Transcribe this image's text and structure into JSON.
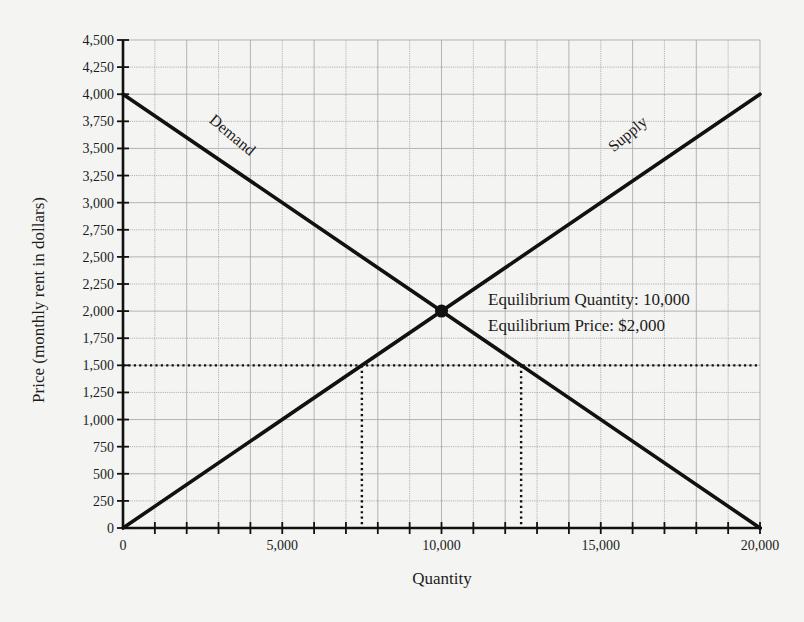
{
  "chart_data": {
    "type": "line",
    "title": "",
    "xlabel": "Quantity",
    "ylabel": "Price (monthly rent in dollars)",
    "xlim": [
      0,
      20000
    ],
    "ylim": [
      0,
      4500
    ],
    "x_ticks": [
      0,
      5000,
      10000,
      15000,
      20000
    ],
    "x_tick_labels": [
      "0",
      "5,000",
      "10,000",
      "15,000",
      "20,000"
    ],
    "x_minor_step": 1000,
    "y_ticks": [
      0,
      250,
      500,
      750,
      1000,
      1250,
      1500,
      1750,
      2000,
      2250,
      2500,
      2750,
      3000,
      3250,
      3500,
      3750,
      4000,
      4250,
      4500
    ],
    "y_tick_labels": [
      "0",
      "250",
      "500",
      "750",
      "1,000",
      "1,250",
      "1,500",
      "1,750",
      "2,000",
      "2,250",
      "2,500",
      "2,750",
      "3,000",
      "3,250",
      "3,500",
      "3,750",
      "4,000",
      "4,250",
      "4,500"
    ],
    "grid": true,
    "legend": null,
    "series": [
      {
        "name": "Demand",
        "x": [
          0,
          20000
        ],
        "y": [
          4000,
          0
        ],
        "label_text": "Demand"
      },
      {
        "name": "Supply",
        "x": [
          0,
          20000
        ],
        "y": [
          0,
          4000
        ],
        "label_text": "Supply"
      }
    ],
    "equilibrium": {
      "x": 10000,
      "y": 2000
    },
    "price_floor_line": {
      "y": 1500,
      "style": "dotted",
      "drop_lines_x": [
        7500,
        12500
      ]
    },
    "annotations": [
      "Equilibrium Quantity: 10,000",
      "Equilibrium Price: $2,000"
    ]
  },
  "labels": {
    "xlabel": "Quantity",
    "ylabel": "Price (monthly rent in dollars)",
    "demand": "Demand",
    "supply": "Supply",
    "eq_quantity": "Equilibrium Quantity: 10,000",
    "eq_price": "Equilibrium Price: $2,000"
  },
  "colors": {
    "background": "#f4f4f2",
    "ink": "#111111",
    "grid": "#a9a9a9"
  }
}
